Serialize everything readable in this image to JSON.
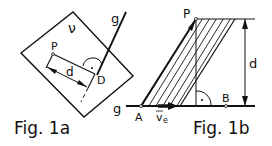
{
  "fig1a": {
    "caption": "Fig. 1a",
    "plane_label": "ν",
    "line_label": "g",
    "point_P": "P",
    "point_D": "D",
    "distance_label": "d"
  },
  "fig1b": {
    "caption": "Fig. 1b",
    "line_label": "g",
    "point_P": "P",
    "point_A": "A",
    "point_B": "B",
    "distance_label": "d",
    "velocity_label": "v",
    "velocity_sub": "e"
  }
}
